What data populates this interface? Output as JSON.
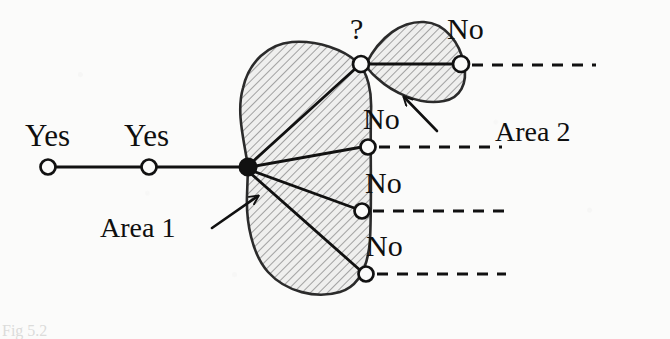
{
  "figure": {
    "type": "hand-drawn-graph-diagram",
    "caption_fragment": "Fig 5.2",
    "ink_color": "#111111",
    "hatch_color": "#5a5a5a",
    "paper_color": "#fbfbfa"
  },
  "labels": {
    "yes_1": "Yes",
    "yes_2": "Yes",
    "question": "?",
    "no_1": "No",
    "no_2": "No",
    "no_3": "No",
    "no_4": "No",
    "area_1": "Area 1",
    "area_2": "Area 2"
  },
  "nodes": [
    {
      "id": "yes-node-1",
      "label": "Yes",
      "kind": "open-circle",
      "x": 48,
      "y": 167
    },
    {
      "id": "yes-node-2",
      "label": "Yes",
      "kind": "open-circle",
      "x": 149,
      "y": 167
    },
    {
      "id": "hub-node",
      "label": "",
      "kind": "filled-circle",
      "x": 248,
      "y": 167
    },
    {
      "id": "no-node-top",
      "label": "?",
      "kind": "open-circle",
      "x": 361,
      "y": 64
    },
    {
      "id": "no-node-2",
      "label": "No",
      "kind": "open-circle",
      "x": 368,
      "y": 147
    },
    {
      "id": "no-node-3",
      "label": "No",
      "kind": "open-circle",
      "x": 362,
      "y": 211
    },
    {
      "id": "no-node-4",
      "label": "No",
      "kind": "open-circle",
      "x": 366,
      "y": 274
    },
    {
      "id": "no-node-far",
      "label": "No",
      "kind": "open-circle",
      "x": 461,
      "y": 64
    }
  ],
  "areas": [
    {
      "id": "area-1",
      "label": "Area 1",
      "fill": "hatched",
      "callout_from": [
        212,
        228
      ],
      "callout_to": [
        258,
        196
      ]
    },
    {
      "id": "area-2",
      "label": "Area 2",
      "fill": "hatched",
      "callout_from": [
        437,
        131
      ],
      "callout_to": [
        404,
        97
      ]
    }
  ],
  "dashed_rays": [
    {
      "from_node": "no-node-far",
      "y": 65,
      "x_start": 472,
      "x_end": 596
    },
    {
      "from_node": "no-node-2",
      "y": 147,
      "x_start": 379,
      "x_end": 502
    },
    {
      "from_node": "no-node-3",
      "y": 211,
      "x_start": 373,
      "x_end": 505
    },
    {
      "from_node": "no-node-4",
      "y": 274,
      "x_start": 377,
      "x_end": 506
    }
  ]
}
